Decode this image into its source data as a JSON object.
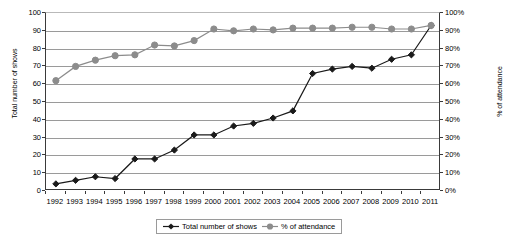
{
  "chart_data": {
    "type": "line",
    "title": "",
    "xlabel": "",
    "ylabel": "Total number of shows",
    "ylabel_secondary": "% of attendance",
    "grid": true,
    "legend_position": "bottom",
    "x": [
      1992,
      1993,
      1994,
      1995,
      1996,
      1997,
      1998,
      1999,
      2000,
      2001,
      2002,
      2003,
      2004,
      2005,
      2006,
      2007,
      2008,
      2009,
      2010,
      2011
    ],
    "categories": [
      "1992",
      "1993",
      "1994",
      "1995",
      "1996",
      "1997",
      "1998",
      "1999",
      "2000",
      "2001",
      "2002",
      "2003",
      "2004",
      "2005",
      "2006",
      "2007",
      "2008",
      "2009",
      "2010",
      "2011"
    ],
    "ylim": [
      0,
      100
    ],
    "ylim_secondary": [
      0,
      100
    ],
    "ytick_labels": [
      "0",
      "10",
      "20",
      "30",
      "40",
      "50",
      "60",
      "70",
      "80",
      "90",
      "100"
    ],
    "ytick_values": [
      0,
      10,
      20,
      30,
      40,
      50,
      60,
      70,
      80,
      90,
      100
    ],
    "ytick_labels_secondary": [
      "0%",
      "10%",
      "20%",
      "30%",
      "40%",
      "50%",
      "60%",
      "70%",
      "80%",
      "90%",
      "100%"
    ],
    "ytick_values_secondary": [
      0,
      10,
      20,
      30,
      40,
      50,
      60,
      70,
      80,
      90,
      100
    ],
    "series": [
      {
        "name": "Total number of shows",
        "axis": "left",
        "color": "#1a1a1a",
        "marker": "diamond",
        "values": [
          4,
          6,
          8,
          7,
          18,
          18,
          23,
          31.5,
          31.5,
          36.5,
          38,
          41,
          45,
          66,
          68.5,
          70,
          69,
          74,
          76.5,
          93
        ]
      },
      {
        "name": "% of attendance",
        "axis": "right",
        "color": "#8c8c8c",
        "marker": "circle",
        "values": [
          62,
          70,
          73.5,
          76,
          76.5,
          82,
          81.5,
          84.5,
          91,
          90,
          91,
          90.5,
          91.5,
          91.5,
          91.5,
          92,
          92,
          91,
          91,
          93
        ]
      }
    ]
  },
  "legend": {
    "items": [
      {
        "label": "Total number of shows",
        "marker": "diamond",
        "color": "#1a1a1a"
      },
      {
        "label": "% of attendance",
        "marker": "circle",
        "color": "#8c8c8c"
      }
    ]
  }
}
